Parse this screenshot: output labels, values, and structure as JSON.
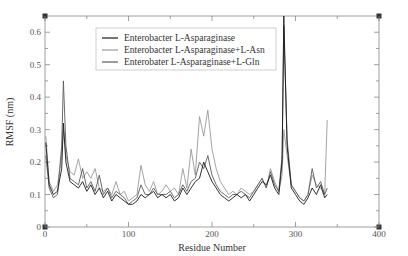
{
  "chart_data": {
    "type": "line",
    "title": "",
    "xlabel": "Residue Number",
    "ylabel": "RMSF (nm)",
    "xlim": [
      0,
      400
    ],
    "ylim": [
      0,
      0.65
    ],
    "x_ticks": [
      0,
      100,
      200,
      300,
      400
    ],
    "y_ticks": [
      0,
      0.1,
      0.2,
      0.3,
      0.4,
      0.5,
      0.6
    ],
    "x_tick_labels": [
      "0",
      "100",
      "200",
      "300",
      "400"
    ],
    "y_tick_labels": [
      "0",
      "0.1",
      "0.2",
      "0.3",
      "0.4",
      "0.5",
      "0.6"
    ],
    "grid": false,
    "legend_position": "upper center",
    "series": [
      {
        "name": "Enterobacter L-Asparaginase",
        "color": "#1a1a1a",
        "x": [
          1,
          5,
          10,
          15,
          20,
          22,
          25,
          30,
          35,
          40,
          45,
          50,
          55,
          60,
          65,
          70,
          75,
          80,
          85,
          90,
          95,
          100,
          105,
          110,
          115,
          120,
          125,
          130,
          135,
          140,
          145,
          150,
          155,
          160,
          165,
          170,
          175,
          180,
          185,
          190,
          195,
          200,
          205,
          210,
          215,
          220,
          225,
          230,
          235,
          240,
          245,
          250,
          255,
          260,
          265,
          270,
          275,
          280,
          284,
          286,
          290,
          295,
          300,
          305,
          310,
          315,
          320,
          325,
          330,
          335,
          338
        ],
        "y": [
          0.26,
          0.13,
          0.1,
          0.11,
          0.18,
          0.32,
          0.2,
          0.14,
          0.13,
          0.12,
          0.14,
          0.11,
          0.13,
          0.1,
          0.12,
          0.09,
          0.11,
          0.08,
          0.1,
          0.09,
          0.08,
          0.07,
          0.07,
          0.08,
          0.1,
          0.09,
          0.1,
          0.11,
          0.09,
          0.1,
          0.09,
          0.1,
          0.08,
          0.09,
          0.12,
          0.1,
          0.12,
          0.14,
          0.15,
          0.2,
          0.17,
          0.14,
          0.12,
          0.1,
          0.09,
          0.08,
          0.09,
          0.1,
          0.09,
          0.1,
          0.08,
          0.1,
          0.12,
          0.14,
          0.13,
          0.16,
          0.12,
          0.1,
          0.2,
          0.65,
          0.25,
          0.12,
          0.1,
          0.08,
          0.07,
          0.09,
          0.12,
          0.1,
          0.13,
          0.09,
          0.1
        ]
      },
      {
        "name": "Enterobacter L-Asparaginase+L-Asn",
        "color": "#9a9a9a",
        "x": [
          1,
          5,
          10,
          15,
          20,
          22,
          25,
          30,
          35,
          40,
          45,
          50,
          55,
          60,
          65,
          70,
          75,
          80,
          85,
          90,
          95,
          100,
          105,
          110,
          115,
          120,
          125,
          130,
          135,
          140,
          145,
          150,
          155,
          160,
          165,
          170,
          175,
          180,
          185,
          190,
          195,
          200,
          205,
          210,
          215,
          220,
          225,
          230,
          235,
          240,
          245,
          250,
          255,
          260,
          265,
          270,
          275,
          280,
          284,
          286,
          290,
          295,
          300,
          305,
          310,
          315,
          320,
          325,
          330,
          335,
          338
        ],
        "y": [
          0.28,
          0.14,
          0.11,
          0.13,
          0.22,
          0.3,
          0.22,
          0.17,
          0.16,
          0.21,
          0.15,
          0.17,
          0.15,
          0.18,
          0.12,
          0.11,
          0.12,
          0.1,
          0.14,
          0.1,
          0.11,
          0.08,
          0.09,
          0.1,
          0.19,
          0.13,
          0.11,
          0.14,
          0.1,
          0.11,
          0.13,
          0.11,
          0.12,
          0.1,
          0.18,
          0.12,
          0.24,
          0.16,
          0.34,
          0.28,
          0.36,
          0.24,
          0.18,
          0.14,
          0.12,
          0.1,
          0.11,
          0.1,
          0.12,
          0.11,
          0.1,
          0.11,
          0.13,
          0.15,
          0.12,
          0.18,
          0.14,
          0.11,
          0.16,
          0.3,
          0.22,
          0.13,
          0.11,
          0.09,
          0.08,
          0.1,
          0.16,
          0.13,
          0.12,
          0.1,
          0.33
        ]
      },
      {
        "name": "Enterobater L-Asparaginase+L-Gln",
        "color": "#5a5a5a",
        "x": [
          1,
          5,
          10,
          15,
          20,
          22,
          25,
          30,
          35,
          40,
          45,
          50,
          55,
          60,
          65,
          70,
          75,
          80,
          85,
          90,
          95,
          100,
          105,
          110,
          115,
          120,
          125,
          130,
          135,
          140,
          145,
          150,
          155,
          160,
          165,
          170,
          175,
          180,
          185,
          190,
          195,
          200,
          205,
          210,
          215,
          220,
          225,
          230,
          235,
          240,
          245,
          250,
          255,
          260,
          265,
          270,
          275,
          280,
          284,
          286,
          290,
          295,
          300,
          305,
          310,
          315,
          320,
          325,
          330,
          335,
          338
        ],
        "y": [
          0.22,
          0.12,
          0.09,
          0.1,
          0.25,
          0.45,
          0.25,
          0.15,
          0.14,
          0.13,
          0.18,
          0.12,
          0.14,
          0.11,
          0.16,
          0.1,
          0.12,
          0.09,
          0.11,
          0.1,
          0.09,
          0.07,
          0.08,
          0.09,
          0.13,
          0.1,
          0.1,
          0.12,
          0.1,
          0.1,
          0.1,
          0.11,
          0.09,
          0.1,
          0.13,
          0.11,
          0.14,
          0.15,
          0.2,
          0.18,
          0.22,
          0.16,
          0.13,
          0.11,
          0.1,
          0.09,
          0.1,
          0.1,
          0.11,
          0.1,
          0.09,
          0.11,
          0.13,
          0.15,
          0.12,
          0.17,
          0.13,
          0.11,
          0.22,
          0.62,
          0.27,
          0.13,
          0.11,
          0.09,
          0.08,
          0.1,
          0.18,
          0.12,
          0.14,
          0.1,
          0.12
        ]
      }
    ]
  }
}
